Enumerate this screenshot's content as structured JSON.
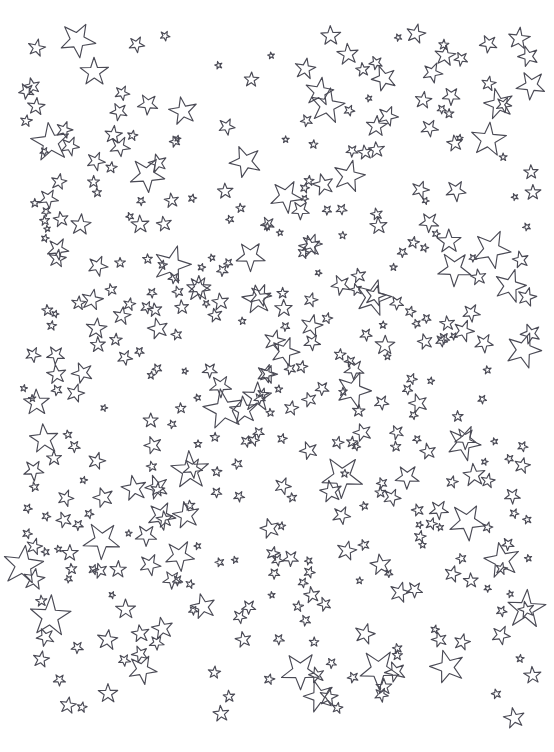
{
  "image": {
    "title": "Scattered Stars Coloring Page",
    "description": "Dense scattered field of hand-drawn five-pointed star outlines on a plain white background",
    "width": 554,
    "height": 752,
    "background_color": "#ffffff",
    "stroke_color": "#4a4a55",
    "stroke_width": 1.15,
    "style": "coloring-book line art",
    "fill": "none"
  },
  "content_bounds": {
    "left": 25,
    "top": 35,
    "right": 536,
    "bottom": 722
  },
  "star_field": {
    "shape": "five-pointed-star",
    "outline_only": true,
    "count": 438,
    "size_range_px": [
      7,
      44
    ],
    "rotation_range_deg": [
      -180,
      180
    ],
    "point_ratio": 0.4,
    "size_classes": [
      {
        "name": "small",
        "approx_px": 10
      },
      {
        "name": "medium",
        "approx_px": 20
      },
      {
        "name": "large",
        "approx_px": 34
      }
    ],
    "generation": {
      "seed": 20240517,
      "margin_left": 22,
      "margin_top": 32,
      "margin_right": 20,
      "margin_bottom": 32,
      "density_note": "denser toward the vertical center band, sparser at the extreme corners"
    }
  }
}
